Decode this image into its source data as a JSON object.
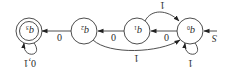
{
  "diagram": {
    "type": "finite-automaton",
    "orientation": "rotated-180",
    "states": [
      {
        "id": "q0",
        "name": "q",
        "sub": "0",
        "start": true,
        "accepting": false
      },
      {
        "id": "q1",
        "name": "q",
        "sub": "1",
        "start": false,
        "accepting": false
      },
      {
        "id": "q2",
        "name": "q",
        "sub": "2",
        "start": false,
        "accepting": false
      },
      {
        "id": "q3",
        "name": "q",
        "sub": "3",
        "start": false,
        "accepting": true
      }
    ],
    "start_label": "S",
    "transitions": [
      {
        "from": "q0",
        "to": "q1",
        "label": "0"
      },
      {
        "from": "q1",
        "to": "q0",
        "label": "1"
      },
      {
        "from": "q1",
        "to": "q2",
        "label": "0"
      },
      {
        "from": "q2",
        "to": "q0",
        "label": "1"
      },
      {
        "from": "q2",
        "to": "q3",
        "label": "0"
      },
      {
        "from": "q0",
        "to": "q0",
        "label": "1"
      },
      {
        "from": "q3",
        "to": "q3",
        "label": "0,1"
      }
    ],
    "colors": {
      "stroke": "#3a3a3a",
      "background": "#ffffff"
    }
  }
}
